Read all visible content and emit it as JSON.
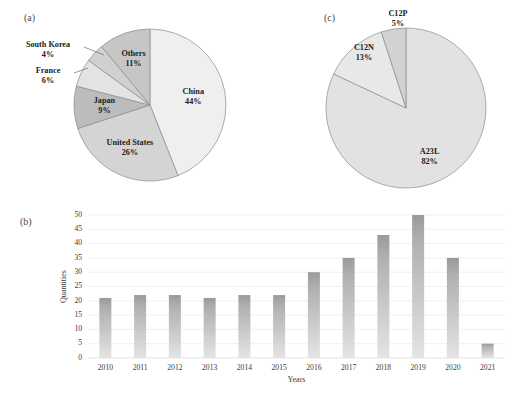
{
  "figure": {
    "panels": {
      "a": {
        "tag": "(a)"
      },
      "b": {
        "tag": "(b)"
      },
      "c": {
        "tag": "(c)"
      }
    }
  },
  "chart_data": [
    {
      "id": "panel-a",
      "type": "pie",
      "title": "(a)",
      "labels": [
        "China",
        "United States",
        "Japan",
        "France",
        "South Korea",
        "Others"
      ],
      "values": [
        44,
        26,
        9,
        6,
        4,
        11
      ],
      "value_labels": [
        "44%",
        "26%",
        "9%",
        "6%",
        "4%",
        "11%"
      ],
      "colors": [
        "#efefef",
        "#d4d4d4",
        "#bcbcbc",
        "#e3e3e3",
        "#d0d0d0",
        "#c6c6c6"
      ],
      "start_angle_deg": 0,
      "direction": "clockwise",
      "legend": "none",
      "labels_outside": [
        "France",
        "South Korea"
      ]
    },
    {
      "id": "panel-b",
      "type": "bar",
      "title": "(b)",
      "categories": [
        "2010",
        "2011",
        "2012",
        "2013",
        "2014",
        "2015",
        "2016",
        "2017",
        "2018",
        "2019",
        "2020",
        "2021"
      ],
      "values": [
        21,
        22,
        22,
        21,
        22,
        22,
        30,
        35,
        43,
        50,
        35,
        5
      ],
      "xlabel": "Years",
      "ylabel": "Quantities",
      "ylim": [
        0,
        50
      ],
      "yticks": [
        0,
        5,
        10,
        15,
        20,
        25,
        30,
        35,
        40,
        45,
        50
      ],
      "grid": true,
      "bar_color_top": "#9a9a9a",
      "bar_color_bottom": "#e2e2e2"
    },
    {
      "id": "panel-c",
      "type": "pie",
      "title": "(c)",
      "labels": [
        "A23L",
        "C12N",
        "C12P"
      ],
      "values": [
        82,
        13,
        5
      ],
      "value_labels": [
        "82%",
        "13%",
        "5%"
      ],
      "colors": [
        "#e2e2e2",
        "#e8e8e8",
        "#d2d2d2"
      ],
      "start_angle_deg": 0,
      "direction": "clockwise",
      "legend": "none"
    }
  ],
  "panel_a": {
    "slices": [
      {
        "name": "China",
        "label": "China",
        "pct": "44%"
      },
      {
        "name": "United States",
        "label": "United States",
        "pct": "26%"
      },
      {
        "name": "Japan",
        "label": "Japan",
        "pct": "9%"
      },
      {
        "name": "France",
        "label": "France",
        "pct": "6%"
      },
      {
        "name": "South Korea",
        "label": "South Korea",
        "pct": "4%"
      },
      {
        "name": "Others",
        "label": "Others",
        "pct": "11%"
      }
    ]
  },
  "panel_c": {
    "slices": [
      {
        "name": "A23L",
        "label": "A23L",
        "pct": "82%"
      },
      {
        "name": "C12N",
        "label": "C12N",
        "pct": "13%"
      },
      {
        "name": "C12P",
        "label": "C12P",
        "pct": "5%"
      }
    ]
  },
  "panel_b": {
    "xlabel": "Years",
    "ylabel": "Quantities",
    "yticks": [
      "0",
      "5",
      "10",
      "15",
      "20",
      "25",
      "30",
      "35",
      "40",
      "45",
      "50"
    ],
    "xticks": [
      "2010",
      "2011",
      "2012",
      "2013",
      "2014",
      "2015",
      "2016",
      "2017",
      "2018",
      "2019",
      "2020",
      "2021"
    ]
  }
}
